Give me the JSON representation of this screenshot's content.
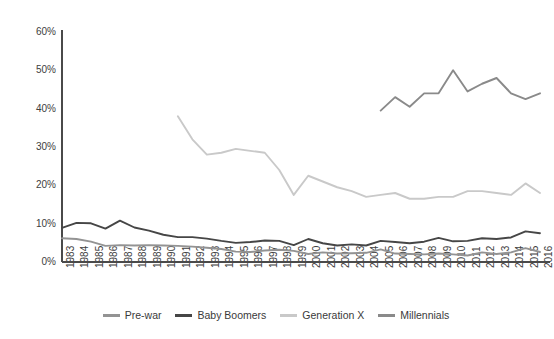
{
  "chart_data": {
    "type": "line",
    "title": "",
    "xlabel": "",
    "ylabel": "",
    "ylim": [
      0,
      60
    ],
    "ytick_labels": [
      "60%",
      "50%",
      "40%",
      "30%",
      "20%",
      "10%",
      "0%"
    ],
    "ytick_values": [
      60,
      50,
      40,
      30,
      20,
      10,
      0
    ],
    "grid": false,
    "legend_position": "bottom-center",
    "x": [
      1983,
      1984,
      1985,
      1986,
      1987,
      1988,
      1989,
      1990,
      1991,
      1992,
      1993,
      1994,
      1995,
      1996,
      1997,
      1998,
      1999,
      2000,
      2001,
      2002,
      2003,
      2004,
      2005,
      2006,
      2007,
      2008,
      2009,
      2010,
      2011,
      2012,
      2013,
      2014,
      2015,
      2016
    ],
    "categories": [
      "1983",
      "1984",
      "1985",
      "1986",
      "1987",
      "1988",
      "1989",
      "1990",
      "1991",
      "1992",
      "1993",
      "1994",
      "1995",
      "1996",
      "1997",
      "1998",
      "1999",
      "2000",
      "2001",
      "2002",
      "2003",
      "2004",
      "2005",
      "2006",
      "2007",
      "2008",
      "2009",
      "2010",
      "2011",
      "2012",
      "2013",
      "2014",
      "2015",
      "2016"
    ],
    "series": [
      {
        "name": "Pre-war",
        "color": "#939393",
        "values": [
          6.2,
          6.0,
          5.3,
          4.2,
          4.4,
          4.3,
          4.4,
          4.3,
          4.2,
          4.0,
          3.7,
          3.4,
          2.7,
          2.6,
          3.0,
          3.2,
          2.9,
          2.1,
          2.5,
          2.2,
          2.3,
          2.4,
          3.3,
          2.2,
          2.1,
          2.0,
          2.2,
          2.0,
          1.7,
          2.5,
          2.1,
          2.5,
          3.6,
          2.6
        ]
      },
      {
        "name": "Baby Boomers",
        "color": "#464646",
        "values": [
          8.9,
          10.2,
          10.1,
          8.7,
          10.8,
          9.0,
          8.2,
          7.1,
          6.5,
          6.5,
          6.1,
          5.5,
          5.0,
          5.2,
          5.6,
          5.5,
          4.4,
          6.0,
          4.9,
          4.3,
          4.6,
          4.3,
          5.5,
          5.2,
          4.9,
          5.3,
          6.3,
          5.4,
          5.5,
          6.2,
          6.0,
          6.4,
          8.0,
          7.5
        ]
      },
      {
        "name": "Generation X",
        "color": "#c9c9c9",
        "values": [
          null,
          null,
          null,
          null,
          null,
          null,
          null,
          null,
          38.0,
          32.0,
          28.0,
          28.5,
          29.5,
          29.0,
          28.5,
          24.0,
          17.5,
          22.5,
          21.0,
          19.5,
          18.5,
          17.0,
          17.5,
          18.0,
          16.5,
          16.5,
          17.0,
          17.0,
          18.5,
          18.5,
          18.0,
          17.5,
          20.5,
          18.0
        ]
      },
      {
        "name": "Millennials",
        "color": "#8a8a8a",
        "values": [
          null,
          null,
          null,
          null,
          null,
          null,
          null,
          null,
          null,
          null,
          null,
          null,
          null,
          null,
          null,
          null,
          null,
          null,
          null,
          null,
          null,
          null,
          39.5,
          43.0,
          40.5,
          44.0,
          44.0,
          50.0,
          44.5,
          46.5,
          48.0,
          44.0,
          42.5,
          44.0
        ]
      }
    ]
  },
  "legend": {
    "items": [
      {
        "label": "Pre-war",
        "color": "#939393"
      },
      {
        "label": "Baby Boomers",
        "color": "#464646"
      },
      {
        "label": "Generation X",
        "color": "#c9c9c9"
      },
      {
        "label": "Millennials",
        "color": "#8a8a8a"
      }
    ]
  },
  "axis": {
    "line_color": "#4a4a4a",
    "tick_text_color": "#404040"
  }
}
